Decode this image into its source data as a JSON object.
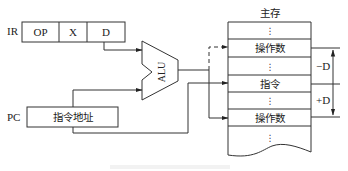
{
  "diagram": {
    "type": "relative-addressing-datapath",
    "ir": {
      "label": "IR",
      "fields": [
        "OP",
        "X",
        "D"
      ]
    },
    "pc": {
      "label": "PC",
      "content": "指令地址"
    },
    "alu": {
      "label": "ALU"
    },
    "memory": {
      "title": "主存",
      "cells": [
        {
          "text": "⋮",
          "kind": "ellipsis"
        },
        {
          "text": "操作数",
          "kind": "operand"
        },
        {
          "text": "⋮",
          "kind": "ellipsis"
        },
        {
          "text": "指令",
          "kind": "instruction"
        },
        {
          "text": "⋮",
          "kind": "ellipsis"
        },
        {
          "text": "操作数",
          "kind": "operand"
        },
        {
          "text": "⋮",
          "kind": "ellipsis"
        }
      ]
    },
    "offsets": {
      "minus": "−D",
      "plus": "+D"
    },
    "connections": [
      {
        "from": "IR.D",
        "to": "ALU.input1",
        "style": "solid"
      },
      {
        "from": "PC",
        "to": "ALU.input2",
        "style": "solid"
      },
      {
        "from": "PC",
        "to": "memory.指令",
        "style": "solid"
      },
      {
        "from": "ALU.output",
        "to": "memory.操作数(−D)",
        "style": "dashed"
      },
      {
        "from": "ALU.output",
        "to": "memory.操作数(+D)",
        "style": "solid"
      }
    ]
  }
}
